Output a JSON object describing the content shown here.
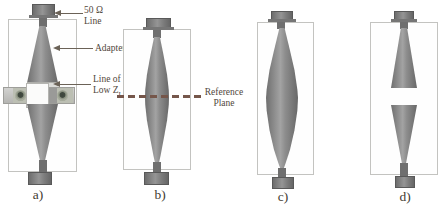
{
  "figure_type": "adapter-calibration-standards-diagram",
  "colors": {
    "background": "#ffffff",
    "taper_metal": "#8d8d8d",
    "connector": "#7d7d7d",
    "outline": "#c3c3c0",
    "clamp_bar": "#c6c6c3",
    "screw": "#5a6353",
    "reference_line": "#75564a",
    "annotation_text": "#51473d"
  },
  "annotations": {
    "fifty_ohm": {
      "line1": "50 Ω",
      "line2": "Line"
    },
    "adapter": {
      "label": "Adapter"
    },
    "low_z": {
      "line1": "Line of",
      "prefix": "Low Z",
      "sub": "L",
      "suffix": "."
    },
    "reference_plane": {
      "line1": "Reference",
      "line2": "Plane"
    }
  },
  "panels": [
    {
      "label": "a)"
    },
    {
      "label": "b)"
    },
    {
      "label": "c)"
    },
    {
      "label": "d)"
    }
  ]
}
